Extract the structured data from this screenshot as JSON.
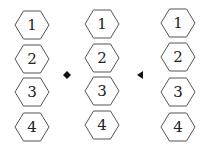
{
  "diagram": {
    "columns": [
      {
        "name": "figure-a",
        "labels": [
          "1",
          "2",
          "3",
          "4"
        ]
      },
      {
        "name": "figure-b",
        "labels": [
          "1",
          "2",
          "3",
          "4"
        ]
      },
      {
        "name": "figure-c",
        "labels": [
          "1",
          "2",
          "3",
          "4"
        ]
      }
    ],
    "markers": [
      {
        "name": "dot-marker",
        "shape": "diamond"
      },
      {
        "name": "triangle-marker",
        "shape": "left-triangle"
      }
    ],
    "stroke_color": "#555555",
    "text_color": "#222222"
  }
}
